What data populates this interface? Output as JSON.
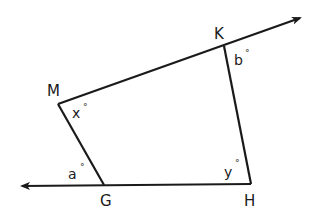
{
  "diagram": {
    "type": "quadrilateral with extended sides",
    "stroke_color": "#1a1a1a",
    "background": "#ffffff",
    "vertices": {
      "M": "M",
      "K": "K",
      "H": "H",
      "G": "G"
    },
    "angles": {
      "b": "b",
      "x": "x",
      "a": "a",
      "y": "y",
      "degree_symbol": "°"
    },
    "rays": [
      {
        "name": "ray-MK",
        "from": "M",
        "through": "K",
        "arrow": "end"
      },
      {
        "name": "ray-HG",
        "from": "H",
        "through": "G",
        "arrow": "end"
      }
    ],
    "segments": [
      "KH",
      "MG"
    ]
  }
}
